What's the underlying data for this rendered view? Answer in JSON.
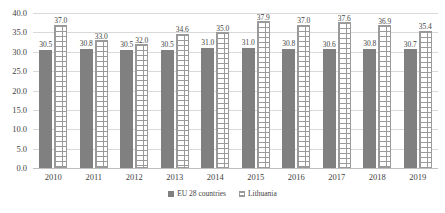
{
  "chart_data": {
    "type": "bar",
    "title": "",
    "subtitle": "",
    "xlabel": "",
    "ylabel": "",
    "categories": [
      "2010",
      "2011",
      "2012",
      "2013",
      "2014",
      "2015",
      "2016",
      "2017",
      "2018",
      "2019"
    ],
    "series": [
      {
        "name": "EU 28 countries",
        "color": "#808080",
        "pattern": "solid",
        "values": [
          30.5,
          30.8,
          30.5,
          30.5,
          31.0,
          31.0,
          30.8,
          30.6,
          30.8,
          30.7
        ],
        "labels": [
          "30.5",
          "30.8",
          "30.5",
          "30.5",
          "31.0",
          "31.0",
          "30.8",
          "30.6",
          "30.8",
          "30.7"
        ]
      },
      {
        "name": "Lithuania",
        "color": "#ffffff",
        "pattern": "brick-hatch",
        "values": [
          37.0,
          33.0,
          32.0,
          34.6,
          35.0,
          37.9,
          37.0,
          37.6,
          36.9,
          35.4
        ],
        "labels": [
          "37.0",
          "33.0",
          "32.0",
          "34.6",
          "35.0",
          "37.9",
          "37.0",
          "37.6",
          "36.9",
          "35.4"
        ]
      }
    ],
    "ylim": [
      0.0,
      40.0
    ],
    "ytick_step": 5.0,
    "yticks": [
      "40.0",
      "35.0",
      "30.0",
      "25.0",
      "20.0",
      "15.0",
      "10.0",
      "5.0",
      "0.0"
    ],
    "grid": "horizontal",
    "legend_position": "bottom",
    "legend": [
      {
        "label": "EU 28 countries",
        "swatch": "solid-gray"
      },
      {
        "label": "Lithuania",
        "swatch": "hatched-white"
      }
    ]
  }
}
